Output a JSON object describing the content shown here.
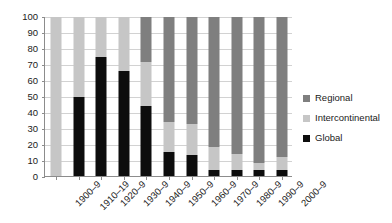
{
  "chart_data": {
    "type": "bar",
    "stacked": true,
    "stack_mode": "percent",
    "title": "",
    "subtitle": "",
    "xlabel": "",
    "ylabel": "",
    "ylim": [
      0,
      100
    ],
    "yticks": [
      0,
      10,
      20,
      30,
      40,
      50,
      60,
      70,
      80,
      90,
      100
    ],
    "ytick_labels": [
      "0",
      "10",
      "20",
      "30",
      "40",
      "50",
      "60",
      "70",
      "80",
      "90",
      "100"
    ],
    "grid": true,
    "grid_axis": "y",
    "legend_position": "right",
    "xtick_rotation": -45,
    "categories": [
      "1900–9",
      "1910–19",
      "1920–9",
      "1930–9",
      "1940–9",
      "1950–9",
      "1960–9",
      "1970–9",
      "1980–9",
      "1990–9",
      "2000–9"
    ],
    "series": [
      {
        "name": "Global",
        "color": "#0d0d0d",
        "values": [
          0,
          50,
          75,
          66,
          44,
          15,
          13,
          4,
          4,
          4,
          4
        ]
      },
      {
        "name": "Intercontinental",
        "color": "#c6c6c6",
        "values": [
          100,
          50,
          25,
          34,
          28,
          19,
          20,
          14,
          10,
          4,
          8
        ]
      },
      {
        "name": "Regional",
        "color": "#7f7f7f",
        "values": [
          0,
          0,
          0,
          0,
          28,
          66,
          67,
          82,
          86,
          92,
          88
        ]
      }
    ],
    "legend_order": [
      "Regional",
      "Intercontinental",
      "Global"
    ],
    "legend": [
      {
        "label": "Regional",
        "color": "#7f7f7f"
      },
      {
        "label": "Intercontinental",
        "color": "#c6c6c6"
      },
      {
        "label": "Global",
        "color": "#0d0d0d"
      }
    ],
    "axis_color": "#8c8c8c",
    "gridline_color": "#d2d2d2"
  }
}
